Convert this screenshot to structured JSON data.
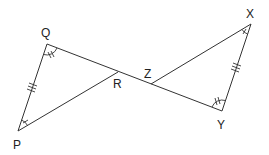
{
  "diagram": {
    "type": "geometry-congruent-triangles",
    "points": {
      "Q": {
        "label": "Q",
        "x": 47,
        "y": 44
      },
      "P": {
        "label": "P",
        "x": 18,
        "y": 131
      },
      "R": {
        "label": "R",
        "x": 118,
        "y": 72
      },
      "Z": {
        "label": "Z",
        "x": 151,
        "y": 84
      },
      "X": {
        "label": "X",
        "x": 251,
        "y": 24
      },
      "Y": {
        "label": "Y",
        "x": 222,
        "y": 111
      }
    },
    "triangles": [
      "PQR",
      "XYZ"
    ],
    "markings": {
      "sides": [
        {
          "segment": "PQ",
          "ticks": 3
        },
        {
          "segment": "XY",
          "ticks": 3
        }
      ],
      "angles": [
        {
          "vertex": "Q",
          "marks": 2
        },
        {
          "vertex": "Y",
          "marks": 2
        },
        {
          "vertex": "P",
          "marks": 1
        },
        {
          "vertex": "X",
          "marks": 1
        }
      ]
    },
    "labels": {
      "Q": "Q",
      "P": "P",
      "R": "R",
      "Z": "Z",
      "X": "X",
      "Y": "Y"
    },
    "stroke_color": "#333333"
  }
}
